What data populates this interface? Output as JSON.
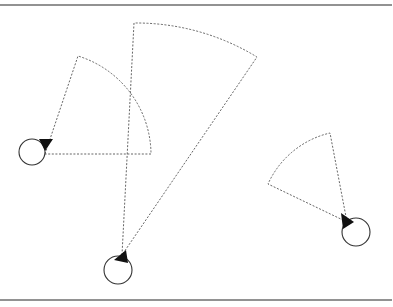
{
  "diagram": {
    "title": "",
    "frame": {
      "top_rule_y": 5,
      "bottom_rule_y": 300,
      "color": "#6e6e6e"
    },
    "colors": {
      "agent_outline": "#333333",
      "heading_marker": "#111111",
      "fov_stroke": "#555555",
      "background": "#ffffff"
    },
    "agents": [
      {
        "id": "agent-1",
        "center": [
          32,
          152
        ],
        "radius": 13,
        "heading_triangle": [
          [
            39,
            139
          ],
          [
            53,
            139
          ],
          [
            45,
            151
          ]
        ],
        "fov": {
          "apex": [
            45,
            154
          ],
          "start_point": [
            78,
            56
          ],
          "end_point": [
            151,
            154
          ],
          "arc_radius": 106
        }
      },
      {
        "id": "agent-2",
        "center": [
          118,
          270
        ],
        "radius": 14,
        "heading_triangle": [
          [
            114,
            260
          ],
          [
            126,
            250
          ],
          [
            128,
            263
          ]
        ],
        "fov": {
          "apex": [
            122,
            255
          ],
          "start_point": [
            134,
            23
          ],
          "end_point": [
            257,
            57
          ],
          "arc_radius": 234
        }
      },
      {
        "id": "agent-3",
        "center": [
          356,
          232
        ],
        "radius": 14,
        "heading_triangle": [
          [
            341,
            213
          ],
          [
            354,
            222
          ],
          [
            343,
            229
          ]
        ],
        "fov": {
          "apex": [
            347,
            222
          ],
          "start_point": [
            330,
            133
          ],
          "end_point": [
            268,
            184
          ],
          "arc_radius": 90
        }
      }
    ]
  }
}
